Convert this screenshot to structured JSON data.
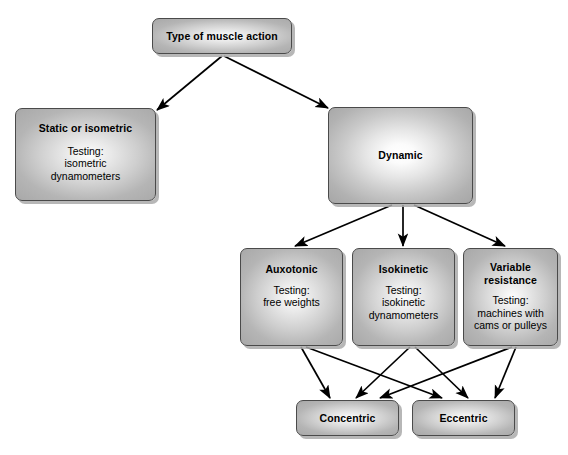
{
  "diagram": {
    "background_color": "#ffffff",
    "box_fill_color": "#c0c0c0",
    "box_border_color": "#4a4a4a",
    "arrow_color": "#000000",
    "nodes": {
      "root": {
        "title": "Type of muscle action",
        "body": ""
      },
      "static": {
        "title": "Static or isometric",
        "body": "Testing:\nisometric\ndynamometers",
        "body_lines": [
          "Testing:",
          "isometric",
          "dynamometers"
        ]
      },
      "dynamic": {
        "title": "Dynamic",
        "body": ""
      },
      "auxotonic": {
        "title": "Auxotonic",
        "body": "Testing:\nfree weights",
        "body_lines": [
          "Testing:",
          "free weights"
        ]
      },
      "isokinetic": {
        "title": "Isokinetic",
        "body": "Testing:\nisokinetic\ndynamometers",
        "body_lines": [
          "Testing:",
          "isokinetic",
          "dynamometers"
        ]
      },
      "variable": {
        "title": "Variable\nresistance",
        "title_lines": [
          "Variable",
          "resistance"
        ],
        "body": "Testing:\nmachines with\ncams or pulleys",
        "body_lines": [
          "Testing:",
          "machines with",
          "cams or pulleys"
        ]
      },
      "concentric": {
        "title": "Concentric",
        "body": ""
      },
      "eccentric": {
        "title": "Eccentric",
        "body": ""
      }
    },
    "edges": [
      {
        "from": "root",
        "to": "static"
      },
      {
        "from": "root",
        "to": "dynamic"
      },
      {
        "from": "dynamic",
        "to": "auxotonic"
      },
      {
        "from": "dynamic",
        "to": "isokinetic"
      },
      {
        "from": "dynamic",
        "to": "variable"
      },
      {
        "from": "auxotonic",
        "to": "concentric"
      },
      {
        "from": "auxotonic",
        "to": "eccentric"
      },
      {
        "from": "isokinetic",
        "to": "concentric"
      },
      {
        "from": "isokinetic",
        "to": "eccentric"
      },
      {
        "from": "variable",
        "to": "concentric"
      },
      {
        "from": "variable",
        "to": "eccentric"
      }
    ]
  }
}
